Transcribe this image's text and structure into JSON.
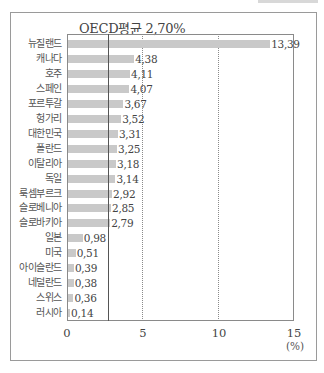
{
  "chart_data": {
    "type": "bar",
    "orientation": "horizontal",
    "title": "",
    "annotation": "OECD평균 2.70%",
    "reference_line": {
      "label": "OECD평균",
      "value": 2.7
    },
    "categories": [
      "뉴질랜드",
      "캐나다",
      "호주",
      "스페인",
      "포르투갈",
      "헝가리",
      "대한민국",
      "폴란드",
      "이탈리아",
      "독일",
      "룩셈부르크",
      "슬로베니아",
      "슬로바키아",
      "일본",
      "미국",
      "아이슬란드",
      "네덜란드",
      "스위스",
      "러시아"
    ],
    "values": [
      13.39,
      4.38,
      4.11,
      4.07,
      3.67,
      3.52,
      3.31,
      3.25,
      3.18,
      3.14,
      2.92,
      2.85,
      2.79,
      0.98,
      0.51,
      0.39,
      0.38,
      0.36,
      0.14
    ],
    "value_labels": [
      "13,39",
      "4,38",
      "4,11",
      "4,07",
      "3,67",
      "3,52",
      "3,31",
      "3,25",
      "3,18",
      "3,14",
      "2,92",
      "2,85",
      "2,79",
      "0,98",
      "0,51",
      "0,39",
      "0,38",
      "0,36",
      "0,14"
    ],
    "xlabel": "(%)",
    "ylabel": "",
    "xlim": [
      0,
      15
    ],
    "xticks": [
      "0",
      "5",
      "10",
      "15"
    ],
    "grid": {
      "vertical_dotted_at": [
        5,
        10
      ]
    },
    "legend": null,
    "colors": {
      "bar": "#c9c9c9",
      "line": "#555555",
      "text": "#444444"
    }
  },
  "labels": {
    "oecd_annotation": "OECD평균 2,70%",
    "unit": "(%)",
    "ticks": [
      "0",
      "5",
      "10",
      "15"
    ]
  }
}
